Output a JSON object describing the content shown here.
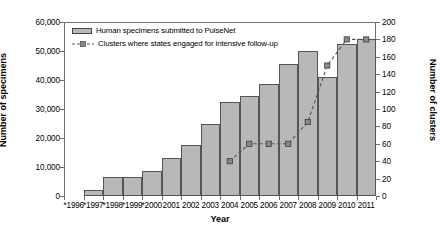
{
  "chart_data": {
    "type": "bar",
    "title": "",
    "xlabel": "Year",
    "ylabel": "Number of specimens",
    "y2label": "Number of clusters",
    "categories": [
      "*1996",
      "*1997",
      "*1998",
      "*1999",
      "*2000",
      "2001",
      "2002",
      "2003",
      "2004",
      "2005",
      "2006",
      "2007",
      "2008",
      "2009",
      "2010",
      "2011"
    ],
    "ylim": [
      0,
      60000
    ],
    "y2lim": [
      0,
      200
    ],
    "yticks": [
      0,
      10000,
      20000,
      30000,
      40000,
      50000,
      60000
    ],
    "ytick_labels": [
      "0",
      "10,000",
      "20,000",
      "30,000",
      "40,000",
      "50,000",
      "60,000"
    ],
    "y2ticks": [
      0,
      20,
      40,
      60,
      80,
      100,
      120,
      140,
      160,
      180,
      200
    ],
    "y2tick_labels": [
      "0",
      "20",
      "40",
      "60",
      "80",
      "100",
      "120",
      "140",
      "160",
      "180",
      "200"
    ],
    "grid": false,
    "legend_position": "top-left",
    "series": [
      {
        "name": "Human specimens submitted to PulseNet",
        "type": "bar",
        "axis": "left",
        "color": "#b8b8b8",
        "edge_color": "#555555",
        "values": [
          0,
          2000,
          6500,
          6500,
          8500,
          13000,
          17500,
          25000,
          32500,
          34500,
          38500,
          45500,
          50000,
          41000,
          52500,
          54000
        ]
      },
      {
        "name": "Clusters where states engaged for intensive follow-up",
        "type": "line",
        "axis": "right",
        "color": "#555555",
        "style": "dashed",
        "marker": "square",
        "values": [
          null,
          null,
          null,
          null,
          null,
          null,
          null,
          null,
          40,
          60,
          60,
          60,
          85,
          150,
          180,
          180
        ]
      }
    ]
  },
  "legend": {
    "items": [
      {
        "label": "Human specimens submitted to PulseNet",
        "kind": "bar"
      },
      {
        "label": "Clusters where states engaged for intensive follow-up",
        "kind": "line"
      }
    ]
  },
  "axes": {
    "y_left_title": "Number of specimens",
    "y_right_title": "Number of clusters",
    "x_title": "Year"
  }
}
